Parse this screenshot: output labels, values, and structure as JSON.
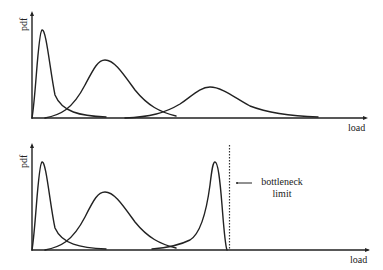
{
  "top_panel": {
    "y_label": "pdf",
    "x_label": "load",
    "curves": [
      {
        "name": "narrow-peak",
        "peak_x": 42,
        "peak_y": 30
      },
      {
        "name": "medium-peak",
        "peak_x": 105,
        "peak_y": 60
      },
      {
        "name": "wide-peak",
        "peak_x": 210,
        "peak_y": 87
      }
    ]
  },
  "bottom_panel": {
    "y_label": "pdf",
    "x_label": "load",
    "annotation": {
      "line1": "bottleneck",
      "line2": "limit"
    },
    "curves": [
      {
        "name": "narrow-peak",
        "peak_x": 42,
        "peak_y": 162
      },
      {
        "name": "medium-peak",
        "peak_x": 105,
        "peak_y": 192
      },
      {
        "name": "limit-peak",
        "peak_x": 215,
        "peak_y": 162
      }
    ]
  },
  "colors": {
    "stroke": "#222222",
    "background": "#ffffff"
  }
}
